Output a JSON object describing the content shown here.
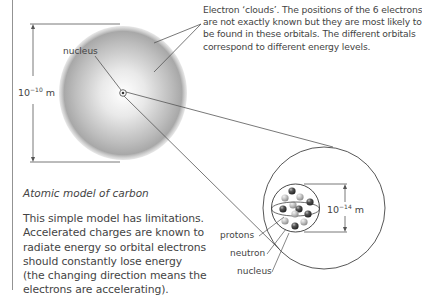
{
  "diagram": {
    "title": "Atomic model of carbon",
    "atom": {
      "size_label": {
        "base": "10",
        "exponent": "−10",
        "unit": "m"
      },
      "nucleus_label": "nucleus",
      "electron_callout": [
        "Electron ‘clouds’. The positions of the 6 electrons",
        "are not exactly known but they are most likely to",
        "be found in these orbitals. The different orbitals",
        "correspond to different energy levels."
      ]
    },
    "nucleus_detail": {
      "size_label": {
        "base": "10",
        "exponent": "−14",
        "unit": "m"
      },
      "labels": [
        "protons",
        "neutron",
        "nucleus"
      ]
    },
    "description": [
      "This simple model has limitations.",
      "Accelerated charges are known to",
      "radiate energy so orbital electrons",
      "should constantly lose energy",
      "(the changing direction means the",
      "electrons are accelerating)."
    ]
  },
  "colors": {
    "line": "#555555",
    "text": "#444444",
    "proton": "#3a3a3a",
    "neutron": "#b5b5b5"
  }
}
